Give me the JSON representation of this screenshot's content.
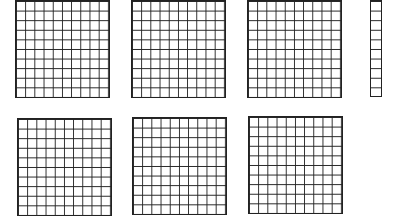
{
  "diagram": {
    "type": "base-ten-blocks",
    "hundreds_count": 6,
    "tens_count": 1,
    "ones_count": 0,
    "represented_value": 610,
    "line_color": "#222222",
    "blocks": [
      {
        "kind": "hundred",
        "rows": 10,
        "cols": 10
      },
      {
        "kind": "hundred",
        "rows": 10,
        "cols": 10
      },
      {
        "kind": "hundred",
        "rows": 10,
        "cols": 10
      },
      {
        "kind": "ten",
        "rows": 10,
        "cols": 1
      },
      {
        "kind": "hundred",
        "rows": 10,
        "cols": 10
      },
      {
        "kind": "hundred",
        "rows": 10,
        "cols": 10
      },
      {
        "kind": "hundred",
        "rows": 10,
        "cols": 10
      }
    ]
  }
}
